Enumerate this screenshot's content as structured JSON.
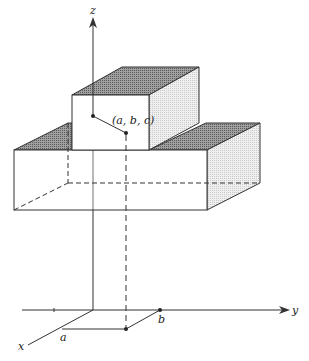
{
  "caption_fragment": "",
  "diagram": {
    "type": "3d-solid-with-coordinate-axes",
    "axes": {
      "x_label": "x",
      "y_label": "y",
      "z_label": "z"
    },
    "point": {
      "label": "(a, b, c)"
    },
    "ground_labels": {
      "a": "a",
      "b": "b"
    },
    "colors": {
      "line": "#333333",
      "shaded_top": "#8a8a8a",
      "shaded_side": "#dcdcdc",
      "face": "#ffffff"
    }
  }
}
